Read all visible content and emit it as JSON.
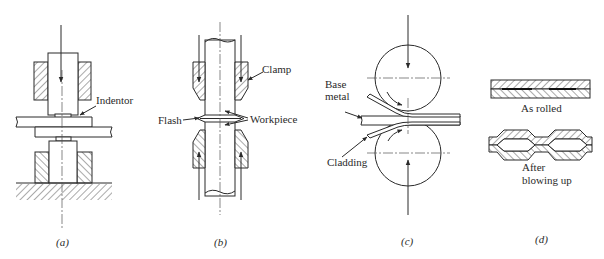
{
  "figure": {
    "panels": [
      {
        "id": "a",
        "caption": "(a)",
        "labels": {
          "indentor": "Indentor"
        }
      },
      {
        "id": "b",
        "caption": "(b)",
        "labels": {
          "clamp": "Clamp",
          "workpiece": "Workpiece",
          "flash": "Flash"
        }
      },
      {
        "id": "c",
        "caption": "(c)",
        "labels": {
          "base_metal_1": "Base",
          "base_metal_2": "metal",
          "cladding": "Cladding"
        }
      },
      {
        "id": "d",
        "caption": "(d)",
        "labels": {
          "as_rolled": "As rolled",
          "after_1": "After",
          "after_2": "blowing up"
        }
      }
    ],
    "colors": {
      "ink": "#2a2a2a",
      "background": "#ffffff"
    }
  }
}
